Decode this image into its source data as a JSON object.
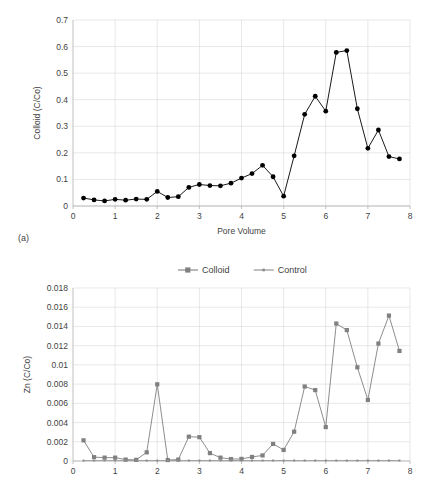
{
  "figure": {
    "panel_a_label": "(a)"
  },
  "chart_data": [
    {
      "id": "colloid-panel-a",
      "type": "line",
      "title": "",
      "xlabel": "Pore Volume",
      "ylabel": "Colloid (C/Co)",
      "xlim": [
        0,
        8
      ],
      "ylim": [
        0,
        0.7
      ],
      "xticks": [
        0,
        1,
        2,
        3,
        4,
        5,
        6,
        7,
        8
      ],
      "xtick_labels": [
        "0",
        "1",
        "2",
        "3",
        "4",
        "5",
        "6",
        "7",
        "8"
      ],
      "yticks": [
        0,
        0.1,
        0.2,
        0.3,
        0.4,
        0.5,
        0.6,
        0.7
      ],
      "ytick_labels": [
        "0",
        "0.1",
        "0.2",
        "0.3",
        "0.4",
        "0.5",
        "0.6",
        "0.7"
      ],
      "grid": true,
      "grid_axis": "both",
      "legend": false,
      "marker": "circle",
      "color": "#000000",
      "series": [
        {
          "name": "Colloid",
          "x": [
            0.25,
            0.5,
            0.75,
            1.0,
            1.25,
            1.5,
            1.75,
            2.0,
            2.25,
            2.5,
            2.75,
            3.0,
            3.25,
            3.5,
            3.75,
            4.0,
            4.25,
            4.5,
            4.75,
            5.0,
            5.25,
            5.5,
            5.75,
            6.0,
            6.25,
            6.5,
            6.75,
            7.0,
            7.25,
            7.5,
            7.75
          ],
          "values": [
            0.03,
            0.023,
            0.019,
            0.025,
            0.022,
            0.026,
            0.025,
            0.055,
            0.032,
            0.035,
            0.07,
            0.081,
            0.077,
            0.076,
            0.086,
            0.105,
            0.122,
            0.153,
            0.11,
            0.037,
            0.189,
            0.345,
            0.413,
            0.357,
            0.578,
            0.585,
            0.366,
            0.217,
            0.286,
            0.186,
            0.177
          ]
        }
      ]
    },
    {
      "id": "zn-panel-b",
      "type": "line",
      "title": "",
      "xlabel": "",
      "ylabel": "Zn (C/Co)",
      "xlim": [
        0,
        8
      ],
      "ylim": [
        0,
        0.018
      ],
      "xticks": [
        0,
        1,
        2,
        3,
        4,
        5,
        6,
        7,
        8
      ],
      "xtick_labels": [
        "0",
        "1",
        "2",
        "3",
        "4",
        "5",
        "6",
        "7",
        "8"
      ],
      "yticks": [
        0,
        0.002,
        0.004,
        0.006,
        0.008,
        0.01,
        0.012,
        0.014,
        0.016,
        0.018
      ],
      "ytick_labels": [
        "0",
        "0.002",
        "0.004",
        "0.006",
        "0.008",
        "0.01",
        "0.012",
        "0.014",
        "0.016",
        "0.018"
      ],
      "grid": true,
      "grid_axis": "both",
      "legend": true,
      "legend_position": "top",
      "legend_entries": [
        "Colloid",
        "Control"
      ],
      "colors": {
        "Colloid": "#808080",
        "Control": "#8c8c8c"
      },
      "series": [
        {
          "name": "Colloid",
          "marker": "square",
          "color": "#808080",
          "x": [
            0.25,
            0.5,
            0.75,
            1.0,
            1.25,
            1.5,
            1.75,
            2.0,
            2.25,
            2.5,
            2.75,
            3.0,
            3.25,
            3.5,
            3.75,
            4.0,
            4.25,
            4.5,
            4.75,
            5.0,
            5.25,
            5.5,
            5.75,
            6.0,
            6.25,
            6.5,
            6.75,
            7.0,
            7.25,
            7.5,
            7.75
          ],
          "values": [
            0.00215,
            0.0004,
            0.00035,
            0.00035,
            0.00015,
            0.00012,
            0.0009,
            0.00798,
            0.0001,
            0.00015,
            0.00253,
            0.00248,
            0.00082,
            0.00035,
            0.0002,
            0.00022,
            0.00042,
            0.00058,
            0.00178,
            0.00115,
            0.00305,
            0.00775,
            0.00738,
            0.00353,
            0.0143,
            0.01362,
            0.00975,
            0.00635,
            0.01222,
            0.01513,
            0.01145
          ]
        },
        {
          "name": "Control",
          "marker": "dot",
          "color": "#8c8c8c",
          "x": [
            0.25,
            0.5,
            0.75,
            1.0,
            1.25,
            1.5,
            1.75,
            2.0,
            2.25,
            2.5,
            2.75,
            3.0,
            3.25,
            3.5,
            3.75,
            4.0,
            4.25,
            4.5,
            4.75,
            5.0,
            5.25,
            5.5,
            5.75,
            6.0,
            6.25,
            6.5,
            6.75,
            7.0,
            7.25,
            7.5,
            7.75
          ],
          "values": [
            4e-05,
            5e-05,
            6e-05,
            6e-05,
            5e-05,
            5e-05,
            5e-05,
            5e-05,
            5e-05,
            5e-05,
            5e-05,
            5e-05,
            5e-05,
            5e-05,
            5e-05,
            5e-05,
            5e-05,
            5e-05,
            5e-05,
            5e-05,
            5e-05,
            5e-05,
            5e-05,
            5e-05,
            5e-05,
            5e-05,
            5e-05,
            5e-05,
            5e-05,
            5e-05,
            5e-05
          ]
        }
      ]
    }
  ]
}
